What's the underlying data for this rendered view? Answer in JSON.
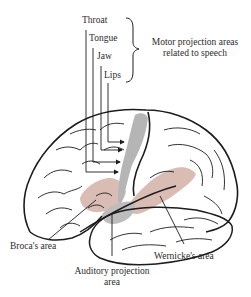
{
  "diagram": {
    "type": "brain-lateral-view",
    "colors": {
      "outline": "#1c1c1c",
      "speech_area_fill": "#d9bcb3",
      "motor_strip_fill": "#b5b5b5",
      "auditory_fill": "#bdbdbd",
      "background": "#ffffff",
      "text": "#2b2b2b"
    },
    "motor_labels": {
      "throat": "Throat",
      "tongue": "Tongue",
      "jaw": "Jaw",
      "lips": "Lips"
    },
    "brace_label": {
      "line1": "Motor projection areas",
      "line2": "related to speech"
    },
    "region_labels": {
      "broca": "Broca's area",
      "wernicke": "Wernicke's area",
      "auditory_line1": "Auditory projection",
      "auditory_line2": "area"
    }
  }
}
